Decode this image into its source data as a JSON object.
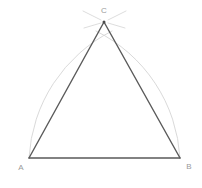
{
  "figure": {
    "canvas": {
      "width": 202,
      "height": 188,
      "background": "#ffffff"
    },
    "colors": {
      "triangle_stroke": "#5a5a5a",
      "arc_stroke": "#cfcfcf",
      "label_text": "#9a9a9a",
      "vertex_dot": "#4a4a4a"
    },
    "stroke_widths": {
      "triangle": 1.4,
      "arc": 0.8,
      "tick": 0.7
    }
  },
  "points": {
    "A": {
      "label": "A",
      "x": 29,
      "y": 158,
      "label_x": 21,
      "label_y": 168
    },
    "B": {
      "label": "B",
      "x": 180,
      "y": 158,
      "label_x": 189,
      "label_y": 167
    },
    "C": {
      "label": "C",
      "x": 104,
      "y": 22,
      "label_x": 104,
      "label_y": 11
    }
  },
  "segments": [
    {
      "name": "side-AB",
      "from": "A",
      "to": "B",
      "d": "M 29 158 L 180 158"
    },
    {
      "name": "side-AC",
      "from": "A",
      "to": "C",
      "d": "M 29 158 L 104 22"
    },
    {
      "name": "side-BC",
      "from": "B",
      "to": "C",
      "d": "M 180 158 L 104 22"
    }
  ],
  "arcs": [
    {
      "name": "arc-centered-at-A",
      "center": "A",
      "radius": 151,
      "d": "M 29 158 A 151 151 0 0 1 112 31"
    },
    {
      "name": "arc-centered-at-B",
      "center": "B",
      "radius": 151,
      "d": "M 180 158 A 151 151 0 0 0 96 31"
    }
  ],
  "arc_tips": [
    {
      "name": "arc-tip-upper-left",
      "d": "M 83 11 L 101 20"
    },
    {
      "name": "arc-tip-upper-right",
      "d": "M 126 11 L 108 20"
    },
    {
      "name": "arc-tip-lower-left",
      "d": "M 84 28 L 101 23"
    },
    {
      "name": "arc-tip-lower-right",
      "d": "M 125 28 L 108 23"
    }
  ],
  "labels": {
    "A": "A",
    "B": "B",
    "C": "C"
  }
}
